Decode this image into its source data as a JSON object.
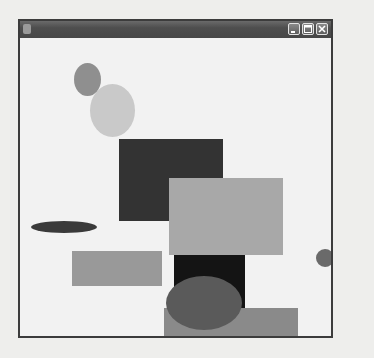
{
  "window": {
    "title": "",
    "controls": {
      "minimize_icon": "minimize-icon",
      "maximize_icon": "maximize-icon",
      "close_icon": "close-icon"
    }
  },
  "canvas": {
    "shapes": [
      {
        "kind": "ellipse",
        "x": 70,
        "y": 46,
        "w": 45,
        "h": 53,
        "color": "#c9c9c9"
      },
      {
        "kind": "ellipse",
        "x": 54,
        "y": 25,
        "w": 27,
        "h": 33,
        "color": "#8f8f8f"
      },
      {
        "kind": "rect",
        "x": 99,
        "y": 101,
        "w": 104,
        "h": 82,
        "color": "#333333"
      },
      {
        "kind": "rect",
        "x": 149,
        "y": 140,
        "w": 114,
        "h": 77,
        "color": "#a8a8a8"
      },
      {
        "kind": "ellipse",
        "x": 11,
        "y": 183,
        "w": 66,
        "h": 12,
        "color": "#3a3a3a"
      },
      {
        "kind": "rect",
        "x": 52,
        "y": 213,
        "w": 90,
        "h": 35,
        "color": "#999999"
      },
      {
        "kind": "rect",
        "x": 154,
        "y": 217,
        "w": 71,
        "h": 54,
        "color": "#141414"
      },
      {
        "kind": "rect",
        "x": 144,
        "y": 270,
        "w": 134,
        "h": 46,
        "color": "#8a8a8a"
      },
      {
        "kind": "ellipse",
        "x": 146,
        "y": 238,
        "w": 76,
        "h": 54,
        "color": "#5a5a5a"
      },
      {
        "kind": "ellipse",
        "x": 296,
        "y": 211,
        "w": 18,
        "h": 18,
        "color": "#6a6a6a"
      }
    ]
  }
}
